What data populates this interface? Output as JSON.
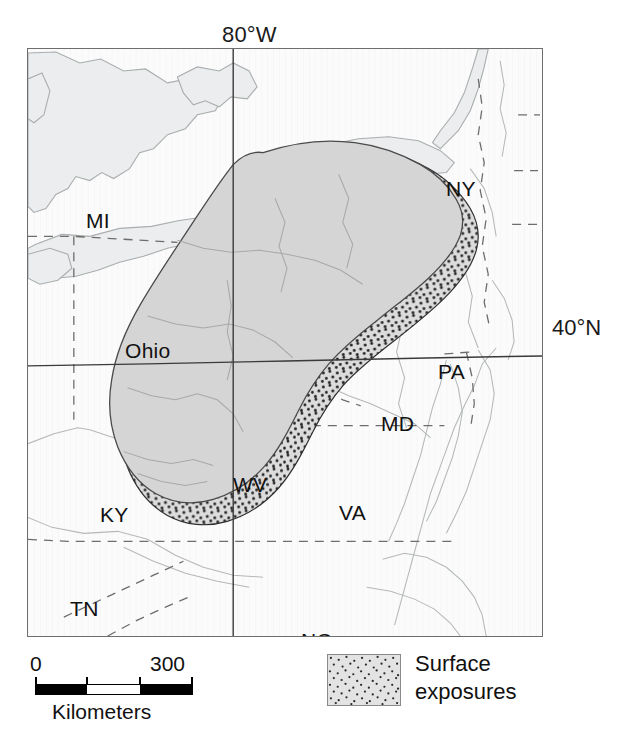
{
  "figure": {
    "type": "thematic-geologic-map",
    "region": "Appalachian Basin, eastern United States"
  },
  "graticule": {
    "longitude_label": "80°W",
    "latitude_label": "40°N"
  },
  "state_labels": [
    {
      "id": "MI",
      "text": "MI",
      "x": 58,
      "y": 160
    },
    {
      "id": "NY",
      "text": "NY",
      "x": 418,
      "y": 128
    },
    {
      "id": "Ohio",
      "text": "Ohio",
      "x": 97,
      "y": 290
    },
    {
      "id": "PA",
      "text": "PA",
      "x": 410,
      "y": 311
    },
    {
      "id": "MD",
      "text": "MD",
      "x": 353,
      "y": 363
    },
    {
      "id": "WV",
      "text": "WV",
      "x": 205,
      "y": 424
    },
    {
      "id": "VA",
      "text": "VA",
      "x": 311,
      "y": 452
    },
    {
      "id": "KY",
      "text": "KY",
      "x": 72,
      "y": 454
    },
    {
      "id": "TN",
      "text": "TN",
      "x": 42,
      "y": 548
    },
    {
      "id": "NC",
      "text": "NC",
      "x": 273,
      "y": 580
    }
  ],
  "scale_bar": {
    "min_label": "0",
    "max_label": "300",
    "units_caption": "Kilometers",
    "segments": [
      "black",
      "white",
      "black"
    ]
  },
  "legend": {
    "swatch_pattern": "stipple-dots",
    "label_line_1": "Surface",
    "label_line_2": "exposures"
  },
  "colors": {
    "basin_fill": "#d5d5d5",
    "basin_outline": "#444444",
    "lake_fill": "#eceded",
    "lake_outline": "#a9adae",
    "map_background": "#fbfbfb",
    "frame_border": "#6e6e6e",
    "state_border_dashed": "#6d6d6d",
    "graticule_line": "#4a4a4a",
    "text": "#111111",
    "stipple_dot": "#2a2a2a",
    "legend_swatch_bg": "#e3e3e3"
  }
}
